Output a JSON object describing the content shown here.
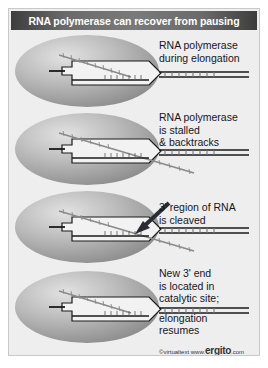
{
  "figure": {
    "title": "RNA polymerase can recover from pausing",
    "credit_prefix": "©virtualtext  www.",
    "credit_brand": "ergito",
    "credit_suffix": ".com"
  },
  "panels": [
    {
      "id": "panel-elongation",
      "caption_lines": [
        "RNA polymerase",
        "during elongation"
      ],
      "state": "elongating"
    },
    {
      "id": "panel-stalled",
      "caption_lines": [
        "RNA polymerase",
        "is stalled",
        "& backtracks"
      ],
      "state": "backtracked"
    },
    {
      "id": "panel-cleaved",
      "caption_lines": [
        "3' region of RNA",
        "is cleaved"
      ],
      "state": "cleavage"
    },
    {
      "id": "panel-resumed",
      "caption_lines": [
        "New 3' end",
        "is located in",
        "catalytic site;",
        "",
        "elongation",
        "resumes"
      ],
      "state": "resumed"
    }
  ],
  "colors": {
    "background": "#eeeeee",
    "title_bar_dark": "#3d3d3d",
    "title_bar_light": "#7a7a7a",
    "title_text": "#ffffff",
    "caption_text": "#15151f",
    "enzyme_light": "#d8d8d8",
    "enzyme_dark": "#8d8d8d",
    "strand_dark": "#1a1a1a",
    "strand_gray": "#8a8a8a",
    "channel_fill": "#f2f2f2"
  },
  "labels": {
    "enzyme": "RNA polymerase body",
    "dna_duplex": "DNA duplex",
    "rna_strand": "RNA transcript",
    "cleavage_arrow": "cleavage site arrow"
  }
}
